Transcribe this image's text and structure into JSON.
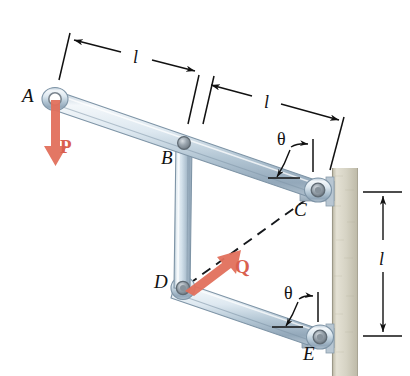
{
  "figure": {
    "background_color": "#ffffff",
    "width": 410,
    "height": 376,
    "colors": {
      "force_arrow": "#e2705c",
      "force_label": "#d9604e",
      "wall_fill": "#cfcbb8",
      "wall_edge": "#a9a593",
      "link_light": "#eef3f7",
      "link_mid": "#c3d2de",
      "link_dark": "#8fa3b4",
      "line": "#111111",
      "pin_dark": "#7d8790"
    },
    "points": [
      {
        "id": "A",
        "label": "A",
        "x": 55,
        "y": 99,
        "label_x": 22,
        "label_y": 90,
        "kind": "free-pin-end"
      },
      {
        "id": "B",
        "label": "B",
        "x": 184,
        "y": 143,
        "label_x": 163,
        "label_y": 152,
        "kind": "pin-joint"
      },
      {
        "id": "C",
        "label": "C",
        "x": 318,
        "y": 190,
        "label_x": 293,
        "label_y": 203,
        "kind": "wall-pin"
      },
      {
        "id": "D",
        "label": "D",
        "x": 183,
        "y": 288,
        "label_x": 156,
        "label_y": 277,
        "kind": "pin-joint"
      },
      {
        "id": "E",
        "label": "E",
        "x": 320,
        "y": 337,
        "label_x": 305,
        "label_y": 345,
        "kind": "wall-pin"
      }
    ],
    "members": [
      {
        "name": "top-bar-AC",
        "from": "A",
        "to": "C",
        "description": "upper rigid bar from A through B to wall pin C"
      },
      {
        "name": "vertical-link-BD",
        "from": "B",
        "to": "D",
        "description": "vertical connecting link"
      },
      {
        "name": "lower-bar-DE",
        "from": "D",
        "to": "E",
        "description": "lower bar from D to wall pin E"
      }
    ],
    "forces": [
      {
        "id": "P",
        "label": "P",
        "applied_at": "A",
        "direction": "down",
        "label_x": 62,
        "label_y": 145,
        "color": "#d9604e"
      },
      {
        "id": "Q",
        "label": "Q",
        "applied_at": "D",
        "direction": "up-right",
        "label_x": 232,
        "label_y": 265,
        "color": "#d9604e"
      }
    ],
    "dimensions": [
      {
        "id": "dim-l-AB",
        "label": "l",
        "label_x": 137,
        "label_y": 58,
        "from": "A",
        "to": "B",
        "orientation": "slanted",
        "arrows": "both"
      },
      {
        "id": "dim-l-BC",
        "label": "l",
        "label_x": 266,
        "label_y": 103,
        "from": "B",
        "to": "C",
        "orientation": "slanted",
        "arrows": "both"
      },
      {
        "id": "dim-l-CE",
        "label": "l",
        "label_x": 383,
        "label_y": 258,
        "from": "C",
        "to": "E",
        "orientation": "vertical",
        "arrows": "both"
      }
    ],
    "angles": [
      {
        "id": "theta-top",
        "label": "θ",
        "label_x": 283,
        "label_y": 139,
        "at": "C",
        "between": "bar-AC and vertical reference"
      },
      {
        "id": "theta-bottom",
        "label": "θ",
        "label_x": 290,
        "label_y": 292,
        "at": "E",
        "between": "bar-DE and vertical reference"
      }
    ],
    "construction_lines": [
      {
        "id": "dashed-CD",
        "label": "",
        "style": "dashed",
        "from": "C",
        "to": "D",
        "description": "dashed reference line from C to D, parallel to force Q"
      }
    ],
    "wall": {
      "name": "wall",
      "x": 332,
      "y": 168,
      "width": 26,
      "height": 208
    }
  }
}
